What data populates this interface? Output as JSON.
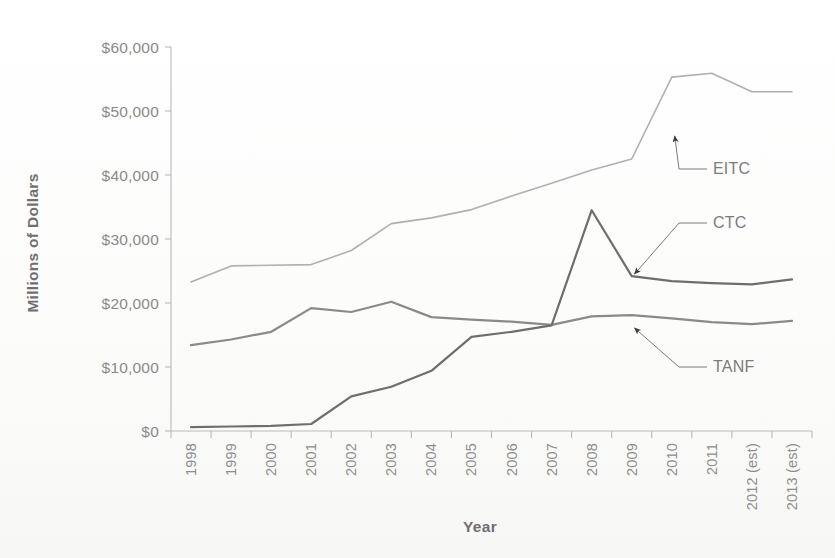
{
  "chart_data": {
    "type": "line",
    "title": "",
    "xlabel": "Year",
    "ylabel": "Millions of Dollars",
    "categories": [
      "1998",
      "1999",
      "2000",
      "2001",
      "2002",
      "2003",
      "2004",
      "2005",
      "2006",
      "2007",
      "2008",
      "2009",
      "2010",
      "2011",
      "2012 (est)",
      "2013 (est)"
    ],
    "ylim": [
      0,
      60000
    ],
    "ytick_values": [
      0,
      10000,
      20000,
      30000,
      40000,
      50000,
      60000
    ],
    "ytick_labels": [
      "$0",
      "$10,000",
      "$20,000",
      "$30,000",
      "$40,000",
      "$50,000",
      "$60,000"
    ],
    "grid": false,
    "legend_position": "inline-annotations",
    "series": [
      {
        "name": "EITC",
        "color": "#b0b0b0",
        "width": 1.6,
        "values": [
          23300,
          25800,
          25900,
          26000,
          28200,
          32400,
          33300,
          34600,
          36700,
          38700,
          40800,
          42500,
          55300,
          55900,
          53000,
          53000
        ]
      },
      {
        "name": "TANF",
        "color": "#8a8a8a",
        "width": 2.2,
        "values": [
          13400,
          14300,
          15500,
          19200,
          18600,
          20200,
          17800,
          17400,
          17100,
          16600,
          17900,
          18100,
          17600,
          17000,
          16700,
          17200
        ]
      },
      {
        "name": "CTC",
        "color": "#6e6e6e",
        "width": 2.2,
        "values": [
          600,
          700,
          800,
          1100,
          5400,
          6900,
          9400,
          14700,
          15500,
          16500,
          34500,
          24200,
          23400,
          23100,
          22900,
          23700
        ]
      }
    ],
    "annotations": [
      {
        "label": "EITC",
        "target_category": "2010",
        "target_value": 47000,
        "label_x": 707,
        "label_y": 174
      },
      {
        "label": "CTC",
        "target_category": "2009",
        "target_value": 25500,
        "label_x": 707,
        "label_y": 228
      },
      {
        "label": "TANF",
        "target_category": "2009",
        "target_value": 17000,
        "label_x": 707,
        "label_y": 372
      }
    ]
  }
}
